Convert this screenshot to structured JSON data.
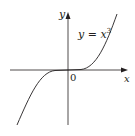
{
  "diagram": {
    "function_label": "y = x",
    "function_exponent": "3",
    "origin_label": "0",
    "x_axis_label": "x",
    "y_axis_label": "y",
    "colors": {
      "stroke": "#231f20",
      "background": "#ffffff"
    }
  }
}
